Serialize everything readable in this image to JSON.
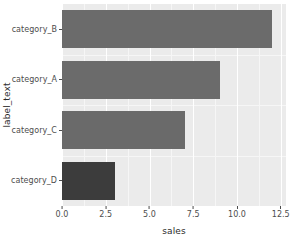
{
  "chart_data": {
    "type": "bar",
    "orientation": "horizontal",
    "title": "",
    "subtitle": "",
    "xlabel": "sales",
    "ylabel": "label_text",
    "categories": [
      "category_B",
      "category_A",
      "category_C",
      "category_D"
    ],
    "values": [
      12,
      9,
      7,
      3
    ],
    "bars": [
      {
        "category": "category_B",
        "value": 12,
        "color": "#6b6b6b"
      },
      {
        "category": "category_A",
        "value": 9,
        "color": "#6b6b6b"
      },
      {
        "category": "category_C",
        "value": 7,
        "color": "#6a6a6a"
      },
      {
        "category": "category_D",
        "value": 3,
        "color": "#3c3c3c"
      }
    ],
    "xlim": [
      0,
      12.8
    ],
    "x_tick_labels": [
      "0.0",
      "2.5",
      "5.0",
      "7.5",
      "10.0",
      "12.5"
    ],
    "x_tick_values": [
      0,
      2.5,
      5,
      7.5,
      10,
      12.5
    ],
    "x_minor_tick_values": [
      1.25,
      3.75,
      6.25,
      8.75,
      11.25
    ],
    "grid": true,
    "legend": "none",
    "panel_background": "#ebebeb",
    "grid_color": "#ffffff",
    "plot_background": "#ffffff"
  },
  "axes": {
    "y_title": "label_text",
    "x_title": "sales"
  }
}
